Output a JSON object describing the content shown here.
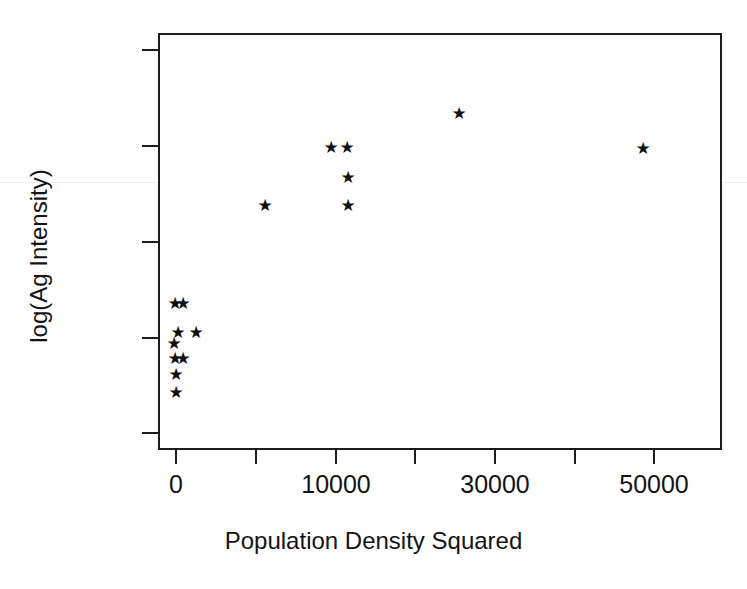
{
  "chart_data": {
    "type": "scatter",
    "title": "",
    "xlabel": "Population Density Squared",
    "ylabel": "log(Ag Intensity)",
    "xlim": [
      -2100,
      63000
    ],
    "ylim": [
      0.42,
      2.59
    ],
    "grid": false,
    "legend": null,
    "marker": "star",
    "marker_glyph": "★",
    "marker_color": "#111111",
    "axis_color": "#1c1c1c",
    "background": "#ffffff",
    "x_ticks": [
      {
        "value": 0,
        "label": "0",
        "px": 176
      },
      {
        "value": 10000,
        "label": "",
        "px": 256
      },
      {
        "value": 20000,
        "label": "10000",
        "px": 336
      },
      {
        "value": 30000,
        "label": "",
        "px": 415
      },
      {
        "value": 40000,
        "label": "30000",
        "px": 495
      },
      {
        "value": 50000,
        "label": "",
        "px": 575
      },
      {
        "value": 60000,
        "label": "50000",
        "px": 654
      }
    ],
    "x_tick_labels_shown": [
      "0",
      "10000",
      "30000",
      "50000"
    ],
    "y_ticks": [
      {
        "value": 2.5,
        "label": "2.5",
        "px": 50
      },
      {
        "value": 2.0,
        "label": "2.0",
        "px": 146
      },
      {
        "value": 1.5,
        "label": "1.5",
        "px": 242
      },
      {
        "value": 1.0,
        "label": "1.0",
        "px": 338
      },
      {
        "value": 0.5,
        "label": "0.5",
        "px": 433
      }
    ],
    "points": [
      {
        "x": 0,
        "y": 1.14,
        "px": 175,
        "py": 303
      },
      {
        "x": 800,
        "y": 1.14,
        "px": 183,
        "py": 303
      },
      {
        "x": 250,
        "y": 0.99,
        "px": 178,
        "py": 332
      },
      {
        "x": 2500,
        "y": 0.99,
        "px": 196,
        "py": 332
      },
      {
        "x": 0,
        "y": 0.94,
        "px": 174,
        "py": 343
      },
      {
        "x": 0,
        "y": 0.86,
        "px": 175,
        "py": 358
      },
      {
        "x": 800,
        "y": 0.86,
        "px": 183,
        "py": 358
      },
      {
        "x": 0,
        "y": 0.78,
        "px": 176,
        "py": 374
      },
      {
        "x": 0,
        "y": 0.69,
        "px": 176,
        "py": 392
      },
      {
        "x": 11200,
        "y": 1.69,
        "px": 265,
        "py": 205
      },
      {
        "x": 19400,
        "y": 1.99,
        "px": 331,
        "py": 147
      },
      {
        "x": 21400,
        "y": 1.99,
        "px": 347,
        "py": 147
      },
      {
        "x": 21600,
        "y": 1.83,
        "px": 348,
        "py": 177
      },
      {
        "x": 21600,
        "y": 1.69,
        "px": 348,
        "py": 205
      },
      {
        "x": 35500,
        "y": 2.16,
        "px": 459,
        "py": 113
      },
      {
        "x": 58800,
        "y": 1.98,
        "px": 643,
        "py": 148
      }
    ],
    "n_points": 16
  }
}
